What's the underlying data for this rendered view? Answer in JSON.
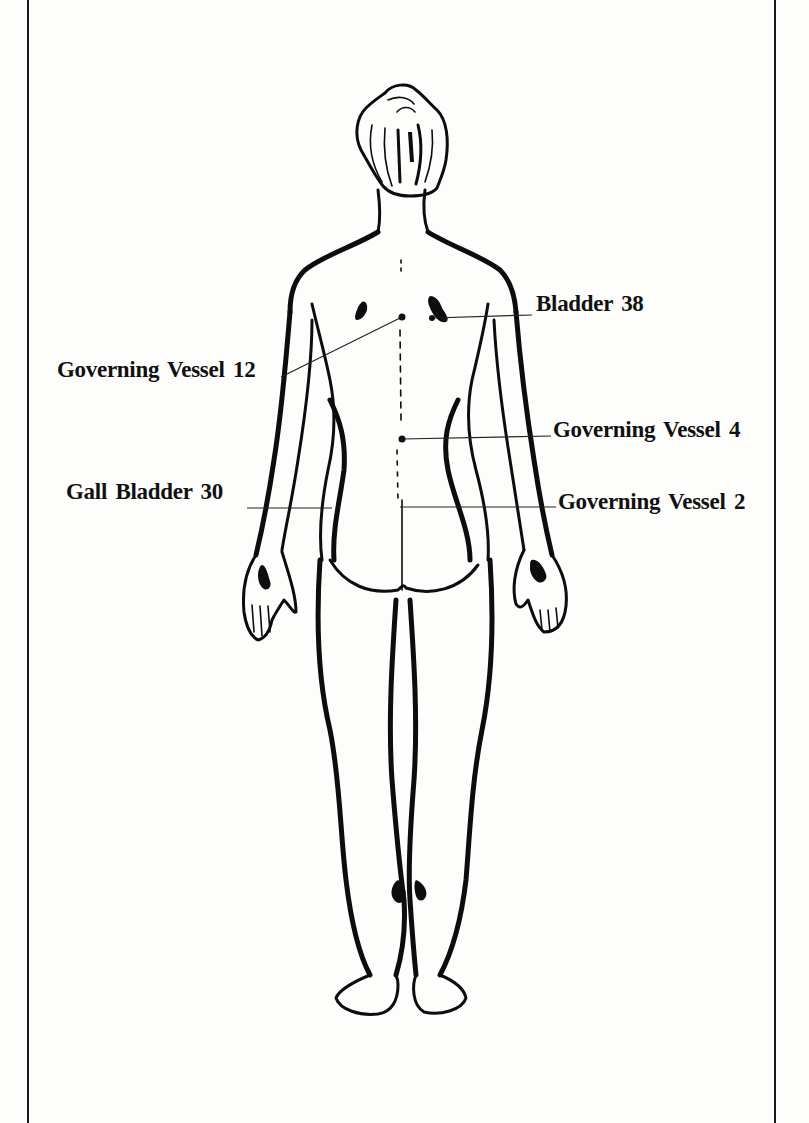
{
  "figure": {
    "view": "posterior",
    "colors": {
      "ink": "#0d0d0d",
      "paper": "#fdfdfb",
      "frame": "#1a1a1a"
    }
  },
  "points": [
    {
      "id": "bladder-38",
      "label": "Bladder 38",
      "side": "right",
      "label_pos": {
        "x": 536,
        "y": 292
      },
      "marker": {
        "x": 432,
        "y": 318
      },
      "leader_end": {
        "x": 532,
        "y": 315
      }
    },
    {
      "id": "governing-vessel-12",
      "label": "Governing Vessel 12",
      "side": "left",
      "label_pos": {
        "x": 57,
        "y": 355
      },
      "marker": {
        "x": 402,
        "y": 317
      },
      "leader_end": {
        "x": 280,
        "y": 377
      }
    },
    {
      "id": "governing-vessel-4",
      "label": "Governing Vessel 4",
      "side": "right",
      "label_pos": {
        "x": 553,
        "y": 416
      },
      "marker": {
        "x": 402,
        "y": 439
      },
      "leader_end": {
        "x": 551,
        "y": 436
      }
    },
    {
      "id": "gall-bladder-30",
      "label": "Gall Bladder 30",
      "side": "left",
      "label_pos": {
        "x": 66,
        "y": 478
      },
      "marker": {
        "x": 330,
        "y": 508
      },
      "leader_end": {
        "x": 247,
        "y": 508
      }
    },
    {
      "id": "governing-vessel-2",
      "label": "Governing Vessel 2",
      "side": "right",
      "label_pos": {
        "x": 558,
        "y": 488
      },
      "marker": {
        "x": 400,
        "y": 507
      },
      "leader_end": {
        "x": 556,
        "y": 507
      }
    }
  ]
}
